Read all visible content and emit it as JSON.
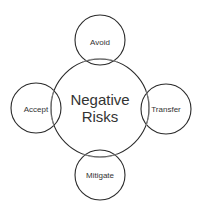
{
  "diagram": {
    "center": {
      "line1": "Negative",
      "line2": "Risks"
    },
    "nodes": {
      "top": "Avoid",
      "left": "Accept",
      "right": "Transfer",
      "bottom": "Mitigate"
    },
    "colors": {
      "stroke": "#2a2a2a",
      "overlap": "#9a9a9a",
      "text": "#333333",
      "background": "#ffffff"
    }
  }
}
